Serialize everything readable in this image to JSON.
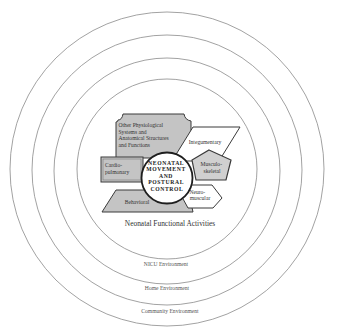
{
  "diagram": {
    "core": {
      "lines": [
        "NEONATAL",
        "MOVEMENT",
        "AND",
        "POSTURAL",
        "CONTROL"
      ]
    },
    "systems": {
      "other_physiological": {
        "lines": [
          "Other Physiological",
          "Systems and",
          "Anatomical Structures",
          "and Functions"
        ]
      },
      "integumentary": {
        "lines": [
          "Integumentary"
        ]
      },
      "cardiopulmonary": {
        "lines": [
          "Cardio-",
          "pulmonary"
        ]
      },
      "musculoskeletal": {
        "lines": [
          "Musculo-",
          "skeletal"
        ]
      },
      "neuromuscular": {
        "lines": [
          "Neuro-",
          "muscular"
        ]
      },
      "behavioral": {
        "lines": [
          "Behavioral"
        ]
      }
    },
    "rings": [
      {
        "label": "Neonatal Functional Activities"
      },
      {
        "label": "NICU Environment"
      },
      {
        "label": "Home Environment"
      },
      {
        "label": "Community Environment"
      }
    ],
    "colors": {
      "ring_stroke": "#8a8a8a",
      "shape_fill_gray": "#c4c4c4",
      "shape_fill_white": "#ffffff",
      "outline": "#3a3a3a",
      "text": "#333333"
    }
  }
}
